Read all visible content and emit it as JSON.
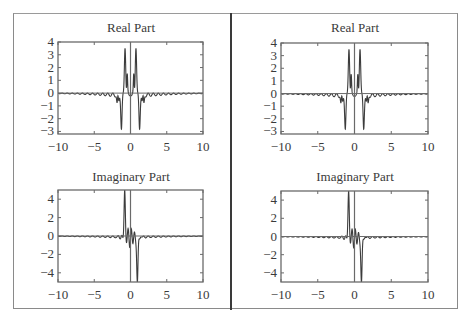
{
  "figure": {
    "panels": [
      {
        "id": "left",
        "label": "Left panel"
      },
      {
        "id": "right",
        "label": "Right panel"
      }
    ]
  },
  "chart_data": [
    {
      "type": "line",
      "panel": "left",
      "position": "top",
      "title": "Real Part",
      "xlabel": "",
      "ylabel": "",
      "xlim": [
        -10,
        10
      ],
      "ylim": [
        -3.2,
        4
      ],
      "xticks": [
        -10,
        -5,
        0,
        5,
        10
      ],
      "xtick_labels": [
        "−10",
        "−5",
        "0",
        "5",
        "10"
      ],
      "yticks": [
        4,
        3,
        2,
        1,
        0,
        -1,
        -2,
        -3
      ],
      "ytick_labels": [
        "4",
        "3",
        "2",
        "1",
        "0",
        "−1",
        "−2",
        "−3"
      ],
      "grid": false,
      "description": "Even oscillatory function: small ripples near 0 for |x|>3, dips to about -1 around |x|~1.8, deep negative spikes near |x|~1.2, positive peaks ~3.8 near |x|~0.8, ~0.4 at x=0",
      "series": [
        {
          "name": "Re",
          "function": "real"
        }
      ]
    },
    {
      "type": "line",
      "panel": "left",
      "position": "bottom",
      "title": "Imaginary Part",
      "xlabel": "",
      "ylabel": "",
      "xlim": [
        -10,
        10
      ],
      "ylim": [
        -5,
        5
      ],
      "xticks": [
        -10,
        -5,
        0,
        5,
        10
      ],
      "xtick_labels": [
        "−10",
        "−5",
        "0",
        "5",
        "10"
      ],
      "yticks": [
        4,
        2,
        0,
        -2,
        -4
      ],
      "ytick_labels": [
        "4",
        "2",
        "0",
        "−2",
        "−4"
      ],
      "grid": false,
      "description": "Odd-like oscillation: peak ~4.8 near x~-0.8, trough ~-5 near x~0.8, ripples amplitude ~1 within |x|<2, decaying to 0 by |x|~4",
      "series": [
        {
          "name": "Im",
          "function": "imag"
        }
      ]
    },
    {
      "type": "line",
      "panel": "right",
      "position": "top",
      "title": "Real Part",
      "xlabel": "",
      "ylabel": "",
      "xlim": [
        -10,
        10
      ],
      "ylim": [
        -3.2,
        4
      ],
      "xticks": [
        -10,
        -5,
        0,
        5,
        10
      ],
      "xtick_labels": [
        "−10",
        "−5",
        "0",
        "5",
        "10"
      ],
      "yticks": [
        4,
        3,
        2,
        1,
        0,
        -1,
        -2,
        -3
      ],
      "ytick_labels": [
        "4",
        "3",
        "2",
        "1",
        "0",
        "−1",
        "−2",
        "−3"
      ],
      "grid": false,
      "series": [
        {
          "name": "Re",
          "function": "real"
        }
      ]
    },
    {
      "type": "line",
      "panel": "right",
      "position": "bottom",
      "title": "Imaginary Part",
      "xlabel": "",
      "ylabel": "",
      "xlim": [
        -10,
        10
      ],
      "ylim": [
        -5,
        5
      ],
      "xticks": [
        -10,
        -5,
        0,
        5,
        10
      ],
      "xtick_labels": [
        "−10",
        "−5",
        "0",
        "5",
        "10"
      ],
      "yticks": [
        4,
        2,
        0,
        -2,
        -4
      ],
      "ytick_labels": [
        "4",
        "2",
        "0",
        "−2",
        "−4"
      ],
      "grid": false,
      "series": [
        {
          "name": "Im",
          "function": "imag"
        }
      ]
    }
  ],
  "layout": {
    "plots": [
      {
        "frame": [
          58,
          42,
          145,
          92
        ],
        "title_center_x": 131,
        "title_y": 20
      },
      {
        "frame": [
          58,
          190,
          145,
          92
        ],
        "title_center_x": 131,
        "title_y": 169
      },
      {
        "frame": [
          281,
          43,
          147,
          91
        ],
        "title_center_x": 355,
        "title_y": 20
      },
      {
        "frame": [
          281,
          191,
          147,
          91
        ],
        "title_center_x": 355,
        "title_y": 169
      }
    ]
  },
  "colors": {
    "curve": "#3c3c3c",
    "frame": "#6a6a6a",
    "text": "#3a3a3a",
    "border": "#8a8a8a",
    "divider": "#3a3a3a"
  }
}
